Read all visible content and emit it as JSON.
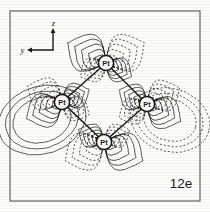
{
  "figure": {
    "label": "12e",
    "background_color": "#fdfdfc",
    "ink_color": "#1a1a1a",
    "frame": {
      "x": 10,
      "y": 11,
      "width": 190,
      "height": 190,
      "stroke_width": 1.1
    }
  },
  "axes_indicator": {
    "vertical_label": "z",
    "horizontal_label": "y",
    "corner_x": 53,
    "corner_y": 50,
    "vertical_tip_y": 28,
    "horizontal_tip_x": 27
  },
  "atoms": [
    {
      "label": "Pt",
      "cx": 106,
      "cy": 63,
      "r": 7.6
    },
    {
      "label": "Pt",
      "cx": 62,
      "cy": 102,
      "r": 7.6
    },
    {
      "label": "Pt",
      "cx": 147,
      "cy": 104,
      "r": 7.6
    },
    {
      "label": "Pt",
      "cx": 104,
      "cy": 142,
      "r": 7.6
    }
  ],
  "chart_data": {
    "type": "contour",
    "title": "12e",
    "xlabel": "y",
    "ylabel": "z",
    "phases": [
      {
        "name": "positive",
        "line_style": "solid"
      },
      {
        "name": "negative",
        "line_style": "dashed"
      }
    ],
    "contour_levels": 5,
    "lobes": [
      {
        "atom": 0,
        "direction": "up-left",
        "phase": "positive",
        "angle": 208,
        "scale": 1.45
      },
      {
        "atom": 0,
        "direction": "up-right",
        "phase": "negative",
        "angle": 332,
        "scale": 1.45
      },
      {
        "atom": 0,
        "direction": "down-left",
        "phase": "negative",
        "angle": 152,
        "scale": 0.92
      },
      {
        "atom": 0,
        "direction": "down-right",
        "phase": "positive",
        "angle": 28,
        "scale": 0.92
      },
      {
        "atom": 1,
        "direction": "up-left",
        "phase": "negative",
        "angle": 205,
        "scale": 1.25
      },
      {
        "atom": 1,
        "direction": "up-right",
        "phase": "positive",
        "angle": 335,
        "scale": 0.95
      },
      {
        "atom": 1,
        "direction": "down-left",
        "phase": "positive",
        "angle": 155,
        "scale": 1.3
      },
      {
        "atom": 1,
        "direction": "down-right",
        "phase": "negative",
        "angle": 25,
        "scale": 0.95
      },
      {
        "atom": 2,
        "direction": "up-left",
        "phase": "positive",
        "angle": 207,
        "scale": 1.0
      },
      {
        "atom": 2,
        "direction": "up-right",
        "phase": "negative",
        "angle": 333,
        "scale": 1.2
      },
      {
        "atom": 2,
        "direction": "down-left",
        "phase": "negative",
        "angle": 153,
        "scale": 1.0
      },
      {
        "atom": 2,
        "direction": "down-right",
        "phase": "positive",
        "angle": 27,
        "scale": 1.25
      },
      {
        "atom": 3,
        "direction": "up-left",
        "phase": "positive",
        "angle": 206,
        "scale": 0.9
      },
      {
        "atom": 3,
        "direction": "up-right",
        "phase": "negative",
        "angle": 334,
        "scale": 0.9
      },
      {
        "atom": 3,
        "direction": "down-left",
        "phase": "negative",
        "angle": 154,
        "scale": 1.45
      },
      {
        "atom": 3,
        "direction": "down-right",
        "phase": "positive",
        "angle": 26,
        "scale": 1.45
      }
    ],
    "outer_envelopes": [
      {
        "phase": "positive",
        "region": "left",
        "cx": 42,
        "cy": 120,
        "rx": 40,
        "ry": 30,
        "rot": -18
      },
      {
        "phase": "negative",
        "region": "right",
        "cx": 170,
        "cy": 120,
        "rx": 36,
        "ry": 28,
        "rot": 16
      }
    ]
  }
}
